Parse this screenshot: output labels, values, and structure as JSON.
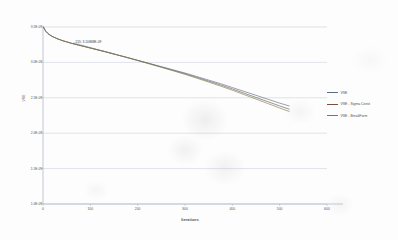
{
  "chart_data": {
    "type": "line",
    "title": "",
    "xlabel": "Iterations",
    "ylabel": "VSE",
    "xlim": [
      0,
      600
    ],
    "ylim": [
      1e-09,
      3.5e-09
    ],
    "grid": true,
    "legend_position": "right",
    "x_ticks": [
      0,
      100,
      200,
      300,
      400,
      500,
      600
    ],
    "x_tick_labels": [
      "0",
      "100",
      "200",
      "300",
      "400",
      "500",
      "600"
    ],
    "y_ticks": [
      3.5e-09,
      3e-09,
      2.5e-09,
      2e-09,
      1.5e-09,
      1e-09
    ],
    "y_tick_labels": [
      "3.5E-09",
      "3.0E-09",
      "2.5E-09",
      "2.0E-09",
      "1.5E-09",
      "1.0E-09"
    ],
    "annotations": [
      {
        "text": "155: 3.10868E-09",
        "x": 155,
        "y": 3.10868e-09
      }
    ],
    "series": [
      {
        "name": "VSE",
        "color": "#5a6b8c",
        "x": [
          1,
          3,
          6,
          10,
          15,
          20,
          25,
          30,
          40,
          50,
          60,
          75,
          90,
          105,
          120,
          135,
          155,
          175,
          200,
          225,
          250,
          275,
          300,
          325,
          350,
          375,
          400,
          425,
          450,
          475,
          500,
          520
        ],
        "y": [
          3.5e-09,
          3.47e-09,
          3.44e-09,
          3.41e-09,
          3.385e-09,
          3.365e-09,
          3.35e-09,
          3.335e-09,
          3.31e-09,
          3.29e-09,
          3.27e-09,
          3.245e-09,
          3.22e-09,
          3.195e-09,
          3.17e-09,
          3.145e-09,
          3.109e-09,
          3.075e-09,
          3.03e-09,
          2.985e-09,
          2.94e-09,
          2.895e-09,
          2.85e-09,
          2.8e-09,
          2.75e-09,
          2.7e-09,
          2.645e-09,
          2.59e-09,
          2.535e-09,
          2.48e-09,
          2.425e-09,
          2.385e-09
        ]
      },
      {
        "name": "VSE - Sigma Const",
        "color": "#7b4f3e",
        "x": [
          1,
          3,
          6,
          10,
          15,
          20,
          25,
          30,
          40,
          50,
          60,
          75,
          90,
          105,
          120,
          135,
          155,
          175,
          200,
          225,
          250,
          275,
          300,
          325,
          350,
          375,
          400,
          425,
          450,
          475,
          500,
          520
        ],
        "y": [
          3.5e-09,
          3.47e-09,
          3.44e-09,
          3.41e-09,
          3.385e-09,
          3.365e-09,
          3.35e-09,
          3.335e-09,
          3.31e-09,
          3.29e-09,
          3.27e-09,
          3.245e-09,
          3.22e-09,
          3.195e-09,
          3.17e-09,
          3.145e-09,
          3.109e-09,
          3.074e-09,
          3.028e-09,
          2.982e-09,
          2.935e-09,
          2.888e-09,
          2.84e-09,
          2.788e-09,
          2.735e-09,
          2.682e-09,
          2.625e-09,
          2.565e-09,
          2.505e-09,
          2.445e-09,
          2.385e-09,
          2.34e-09
        ]
      },
      {
        "name": "VSE - BreakForm",
        "color": "#6f7f55",
        "x": [
          1,
          3,
          6,
          10,
          15,
          20,
          25,
          30,
          40,
          50,
          60,
          75,
          90,
          105,
          120,
          135,
          155,
          175,
          200,
          225,
          250,
          275,
          300,
          325,
          350,
          375,
          400,
          425,
          450,
          475,
          500,
          520
        ],
        "y": [
          3.5e-09,
          3.47e-09,
          3.44e-09,
          3.41e-09,
          3.385e-09,
          3.365e-09,
          3.35e-09,
          3.335e-09,
          3.31e-09,
          3.29e-09,
          3.27e-09,
          3.245e-09,
          3.22e-09,
          3.195e-09,
          3.17e-09,
          3.145e-09,
          3.109e-09,
          3.073e-09,
          3.026e-09,
          2.978e-09,
          2.93e-09,
          2.881e-09,
          2.831e-09,
          2.777e-09,
          2.722e-09,
          2.666e-09,
          2.607e-09,
          2.545e-09,
          2.482e-09,
          2.419e-09,
          2.356e-09,
          2.308e-09
        ]
      }
    ]
  },
  "legend": {
    "items": [
      {
        "label": "VSE",
        "color": "#5a6b8c"
      },
      {
        "label": "VSE - Sigma Const",
        "color": "#7b4f3e"
      },
      {
        "label": "VSE - BreakForm",
        "color": "#6f7f55"
      }
    ]
  }
}
